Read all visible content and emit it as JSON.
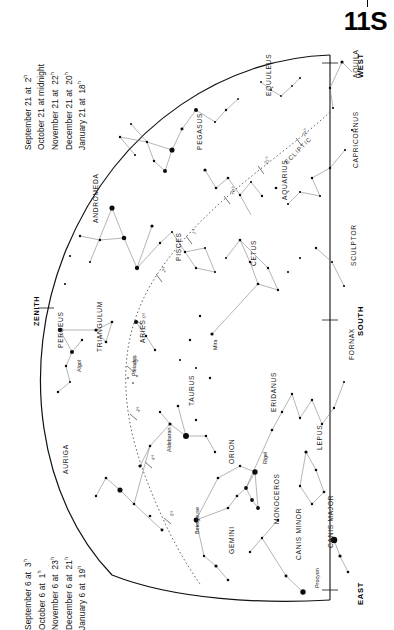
{
  "page": {
    "number": "11S"
  },
  "header_dates": {
    "title": "Evening dates (top)",
    "lines": [
      {
        "label": "September 21 at",
        "time": "2",
        "sup": "h"
      },
      {
        "label": "October 21 at midnight",
        "time": "",
        "sup": ""
      },
      {
        "label": "November 21 at",
        "time": "22",
        "sup": "h"
      },
      {
        "label": "December 21 at",
        "time": "20",
        "sup": "h"
      },
      {
        "label": "January 21 at",
        "time": "18",
        "sup": "h"
      }
    ]
  },
  "footer_dates": {
    "title": "Evening dates (bottom)",
    "lines": [
      {
        "label": "September 6 at",
        "time": "3",
        "sup": "h"
      },
      {
        "label": "October 6 at",
        "time": "1",
        "sup": "h"
      },
      {
        "label": "November 6 at",
        "time": "23",
        "sup": "h"
      },
      {
        "label": "December 6 at",
        "time": "21",
        "sup": "h"
      },
      {
        "label": "January 6 at",
        "time": "19",
        "sup": "h"
      }
    ]
  },
  "compass": {
    "west": "WEST",
    "east": "EAST",
    "south": "SOUTH",
    "zenith": "ZENITH"
  },
  "ecliptic": {
    "label": "ECLIPTIC",
    "hour_marks": [
      "22",
      "21",
      "20",
      "1",
      "2",
      "0",
      "23",
      "3",
      "4",
      "5",
      "6"
    ]
  },
  "chart_data": {
    "type": "scatter",
    "xlabel": "",
    "ylabel": "",
    "constellations": [
      {
        "name": "AQUILA",
        "x": 352,
        "y": 78,
        "rot": -90
      },
      {
        "name": "EQUULEUS",
        "x": 265,
        "y": 96,
        "rot": -90
      },
      {
        "name": "PEGASUS",
        "x": 196,
        "y": 150,
        "rot": -90
      },
      {
        "name": "CAPRICORNUS",
        "x": 352,
        "y": 168,
        "rot": -90
      },
      {
        "name": "AQUARIUS",
        "x": 281,
        "y": 200,
        "rot": -90
      },
      {
        "name": "ANDROMEDA",
        "x": 92,
        "y": 223,
        "rot": -90
      },
      {
        "name": "PISCES",
        "x": 175,
        "y": 261,
        "rot": -90
      },
      {
        "name": "CETUS",
        "x": 250,
        "y": 266,
        "rot": -90
      },
      {
        "name": "SCULPTOR",
        "x": 350,
        "y": 266,
        "rot": -90
      },
      {
        "name": "PERSEUS",
        "x": 57,
        "y": 348,
        "rot": -90
      },
      {
        "name": "TRIANGULUM",
        "x": 96,
        "y": 352,
        "rot": -90
      },
      {
        "name": "ARIES",
        "x": 139,
        "y": 343,
        "rot": -90
      },
      {
        "name": "FORNAX",
        "x": 348,
        "y": 360,
        "rot": -90
      },
      {
        "name": "TAURUS",
        "x": 188,
        "y": 406,
        "rot": -90
      },
      {
        "name": "ERIDANUS",
        "x": 270,
        "y": 412,
        "rot": -90
      },
      {
        "name": "AURIGA",
        "x": 62,
        "y": 474,
        "rot": -90
      },
      {
        "name": "ORION",
        "x": 228,
        "y": 464,
        "rot": -90
      },
      {
        "name": "LEPUS",
        "x": 316,
        "y": 450,
        "rot": -90
      },
      {
        "name": "MONOCEROS",
        "x": 273,
        "y": 524,
        "rot": -90
      },
      {
        "name": "GEMINI",
        "x": 228,
        "y": 554,
        "rot": -90
      },
      {
        "name": "CANIS MINOR",
        "x": 295,
        "y": 560,
        "rot": -90
      },
      {
        "name": "CANIS MAJOR",
        "x": 327,
        "y": 548,
        "rot": -90
      }
    ],
    "named_stars": [
      {
        "name": "Algol",
        "x": 76,
        "y": 372,
        "rot": -90
      },
      {
        "name": "Pleiades",
        "x": 131,
        "y": 376,
        "rot": -90
      },
      {
        "name": "Aldebaran",
        "x": 166,
        "y": 452,
        "rot": -90
      },
      {
        "name": "Mira",
        "x": 212,
        "y": 350,
        "rot": -90
      },
      {
        "name": "Rigel",
        "x": 262,
        "y": 464,
        "rot": -90
      },
      {
        "name": "Betelgeuse",
        "x": 194,
        "y": 534,
        "rot": -90
      },
      {
        "name": "Procyon",
        "x": 314,
        "y": 588,
        "rot": -90
      }
    ],
    "stars": [
      {
        "x": 342,
        "y": 62,
        "m": 1.2
      },
      {
        "x": 330,
        "y": 88,
        "m": 0.9
      },
      {
        "x": 333,
        "y": 108,
        "m": 0.8
      },
      {
        "x": 300,
        "y": 78,
        "m": 0.8
      },
      {
        "x": 292,
        "y": 86,
        "m": 0.7
      },
      {
        "x": 281,
        "y": 96,
        "m": 0.7
      },
      {
        "x": 261,
        "y": 82,
        "m": 0.7
      },
      {
        "x": 271,
        "y": 90,
        "m": 0.7
      },
      {
        "x": 238,
        "y": 99,
        "m": 0.7
      },
      {
        "x": 226,
        "y": 110,
        "m": 0.9
      },
      {
        "x": 215,
        "y": 122,
        "m": 0.8
      },
      {
        "x": 196,
        "y": 110,
        "m": 1.5
      },
      {
        "x": 182,
        "y": 129,
        "m": 1.1
      },
      {
        "x": 172,
        "y": 150,
        "m": 1.9
      },
      {
        "x": 165,
        "y": 171,
        "m": 1.5
      },
      {
        "x": 154,
        "y": 161,
        "m": 0.9
      },
      {
        "x": 147,
        "y": 142,
        "m": 0.9
      },
      {
        "x": 131,
        "y": 124,
        "m": 0.8
      },
      {
        "x": 120,
        "y": 137,
        "m": 0.9
      },
      {
        "x": 135,
        "y": 155,
        "m": 0.8
      },
      {
        "x": 205,
        "y": 170,
        "m": 1.2
      },
      {
        "x": 216,
        "y": 188,
        "m": 1.0
      },
      {
        "x": 228,
        "y": 178,
        "m": 1.0
      },
      {
        "x": 240,
        "y": 195,
        "m": 0.9
      },
      {
        "x": 251,
        "y": 182,
        "m": 0.8
      },
      {
        "x": 262,
        "y": 196,
        "m": 0.9
      },
      {
        "x": 276,
        "y": 188,
        "m": 1.0
      },
      {
        "x": 288,
        "y": 204,
        "m": 0.8
      },
      {
        "x": 300,
        "y": 192,
        "m": 0.8
      },
      {
        "x": 312,
        "y": 178,
        "m": 0.9
      },
      {
        "x": 320,
        "y": 196,
        "m": 0.8
      },
      {
        "x": 330,
        "y": 168,
        "m": 0.9
      },
      {
        "x": 345,
        "y": 150,
        "m": 0.8
      },
      {
        "x": 352,
        "y": 130,
        "m": 0.8
      },
      {
        "x": 112,
        "y": 208,
        "m": 1.9
      },
      {
        "x": 124,
        "y": 238,
        "m": 1.7
      },
      {
        "x": 137,
        "y": 268,
        "m": 1.6
      },
      {
        "x": 100,
        "y": 240,
        "m": 0.9
      },
      {
        "x": 90,
        "y": 262,
        "m": 0.8
      },
      {
        "x": 80,
        "y": 236,
        "m": 0.9
      },
      {
        "x": 70,
        "y": 256,
        "m": 0.8
      },
      {
        "x": 65,
        "y": 284,
        "m": 0.8
      },
      {
        "x": 152,
        "y": 226,
        "m": 1.2
      },
      {
        "x": 160,
        "y": 243,
        "m": 0.9
      },
      {
        "x": 172,
        "y": 232,
        "m": 0.8
      },
      {
        "x": 185,
        "y": 252,
        "m": 0.9
      },
      {
        "x": 196,
        "y": 268,
        "m": 0.9
      },
      {
        "x": 205,
        "y": 248,
        "m": 0.8
      },
      {
        "x": 215,
        "y": 272,
        "m": 0.8
      },
      {
        "x": 226,
        "y": 258,
        "m": 0.8
      },
      {
        "x": 240,
        "y": 240,
        "m": 1.0
      },
      {
        "x": 250,
        "y": 262,
        "m": 0.9
      },
      {
        "x": 258,
        "y": 284,
        "m": 1.0
      },
      {
        "x": 268,
        "y": 268,
        "m": 0.9
      },
      {
        "x": 278,
        "y": 290,
        "m": 0.9
      },
      {
        "x": 288,
        "y": 272,
        "m": 0.8
      },
      {
        "x": 300,
        "y": 258,
        "m": 0.8
      },
      {
        "x": 316,
        "y": 248,
        "m": 0.9
      },
      {
        "x": 332,
        "y": 262,
        "m": 0.8
      },
      {
        "x": 344,
        "y": 286,
        "m": 0.8
      },
      {
        "x": 60,
        "y": 330,
        "m": 1.6
      },
      {
        "x": 72,
        "y": 352,
        "m": 1.5
      },
      {
        "x": 82,
        "y": 340,
        "m": 0.9
      },
      {
        "x": 66,
        "y": 366,
        "m": 0.9
      },
      {
        "x": 70,
        "y": 382,
        "m": 0.8
      },
      {
        "x": 58,
        "y": 392,
        "m": 0.9
      },
      {
        "x": 96,
        "y": 330,
        "m": 1.2
      },
      {
        "x": 106,
        "y": 342,
        "m": 1.0
      },
      {
        "x": 112,
        "y": 322,
        "m": 1.0
      },
      {
        "x": 136,
        "y": 322,
        "m": 1.5
      },
      {
        "x": 146,
        "y": 336,
        "m": 0.9
      },
      {
        "x": 155,
        "y": 350,
        "m": 0.9
      },
      {
        "x": 212,
        "y": 334,
        "m": 1.2
      },
      {
        "x": 200,
        "y": 316,
        "m": 0.9
      },
      {
        "x": 190,
        "y": 340,
        "m": 0.9
      },
      {
        "x": 180,
        "y": 360,
        "m": 0.8
      },
      {
        "x": 196,
        "y": 368,
        "m": 0.8
      },
      {
        "x": 210,
        "y": 378,
        "m": 0.9
      },
      {
        "x": 128,
        "y": 378,
        "m": 0.6
      },
      {
        "x": 133,
        "y": 383,
        "m": 0.6
      },
      {
        "x": 137,
        "y": 376,
        "m": 0.6
      },
      {
        "x": 186,
        "y": 436,
        "m": 2.2
      },
      {
        "x": 170,
        "y": 424,
        "m": 1.2
      },
      {
        "x": 160,
        "y": 412,
        "m": 0.9
      },
      {
        "x": 178,
        "y": 406,
        "m": 1.0
      },
      {
        "x": 196,
        "y": 420,
        "m": 0.9
      },
      {
        "x": 206,
        "y": 436,
        "m": 0.9
      },
      {
        "x": 215,
        "y": 452,
        "m": 0.9
      },
      {
        "x": 150,
        "y": 446,
        "m": 1.0
      },
      {
        "x": 140,
        "y": 466,
        "m": 1.2
      },
      {
        "x": 255,
        "y": 472,
        "m": 2.0
      },
      {
        "x": 246,
        "y": 488,
        "m": 1.4
      },
      {
        "x": 252,
        "y": 500,
        "m": 1.4
      },
      {
        "x": 258,
        "y": 508,
        "m": 1.4
      },
      {
        "x": 237,
        "y": 496,
        "m": 1.0
      },
      {
        "x": 228,
        "y": 508,
        "m": 1.0
      },
      {
        "x": 196,
        "y": 520,
        "m": 1.8
      },
      {
        "x": 218,
        "y": 478,
        "m": 1.0
      },
      {
        "x": 240,
        "y": 466,
        "m": 0.9
      },
      {
        "x": 272,
        "y": 430,
        "m": 1.0
      },
      {
        "x": 282,
        "y": 412,
        "m": 0.9
      },
      {
        "x": 292,
        "y": 394,
        "m": 0.9
      },
      {
        "x": 300,
        "y": 418,
        "m": 0.9
      },
      {
        "x": 312,
        "y": 400,
        "m": 0.9
      },
      {
        "x": 322,
        "y": 424,
        "m": 0.9
      },
      {
        "x": 334,
        "y": 408,
        "m": 0.9
      },
      {
        "x": 344,
        "y": 382,
        "m": 0.8
      },
      {
        "x": 306,
        "y": 452,
        "m": 1.2
      },
      {
        "x": 316,
        "y": 470,
        "m": 1.0
      },
      {
        "x": 324,
        "y": 492,
        "m": 1.0
      },
      {
        "x": 300,
        "y": 486,
        "m": 0.9
      },
      {
        "x": 312,
        "y": 504,
        "m": 0.9
      },
      {
        "x": 334,
        "y": 540,
        "m": 2.4
      },
      {
        "x": 340,
        "y": 556,
        "m": 1.2
      },
      {
        "x": 348,
        "y": 572,
        "m": 1.0
      },
      {
        "x": 303,
        "y": 592,
        "m": 2.0
      },
      {
        "x": 286,
        "y": 576,
        "m": 1.1
      },
      {
        "x": 262,
        "y": 538,
        "m": 0.9
      },
      {
        "x": 278,
        "y": 520,
        "m": 0.9
      },
      {
        "x": 250,
        "y": 552,
        "m": 0.9
      },
      {
        "x": 216,
        "y": 566,
        "m": 1.2
      },
      {
        "x": 228,
        "y": 580,
        "m": 1.0
      },
      {
        "x": 204,
        "y": 556,
        "m": 0.9
      },
      {
        "x": 120,
        "y": 490,
        "m": 1.9
      },
      {
        "x": 106,
        "y": 478,
        "m": 1.0
      },
      {
        "x": 96,
        "y": 496,
        "m": 0.9
      },
      {
        "x": 134,
        "y": 504,
        "m": 1.0
      },
      {
        "x": 150,
        "y": 516,
        "m": 1.0
      },
      {
        "x": 162,
        "y": 530,
        "m": 1.1
      }
    ]
  }
}
